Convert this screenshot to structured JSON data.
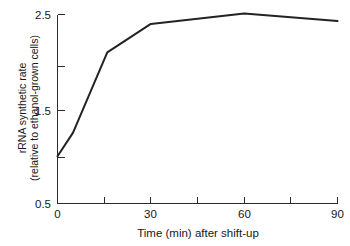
{
  "chart_data": {
    "type": "line",
    "title": "",
    "subtitle": "",
    "xlabel": "Time (min) after shift-up",
    "ylabel": "rRNA synthetic rate (relative to ethanol-grown cells)",
    "ylabel_line1": "rRNA synthetic rate",
    "ylabel_line2": "(relative to ethanol-grown cells)",
    "xlim": [
      0,
      90
    ],
    "ylim": [
      0.5,
      2.5
    ],
    "grid": false,
    "legend": "none",
    "x_major_ticks": [
      0,
      30,
      60,
      90
    ],
    "x_major_tick_labels": [
      "0",
      "30",
      "60",
      "90"
    ],
    "x_minor_ticks": [
      15,
      45,
      75
    ],
    "y_major_ticks": [
      0.5,
      1.5,
      2.5
    ],
    "y_major_tick_labels": [
      "0.5",
      "1.5",
      "2.5"
    ],
    "y_minor_ticks": [
      1.0,
      2.0
    ],
    "series": [
      {
        "name": "rRNA synthetic rate",
        "color": "#232323",
        "x": [
          0,
          5,
          16,
          30,
          60,
          90
        ],
        "y": [
          1.0,
          1.25,
          2.1,
          2.4,
          2.51,
          2.43
        ]
      }
    ]
  },
  "axis": {
    "x_title": "Time (min) after shift-up",
    "y_title_line1": "rRNA synthetic rate",
    "y_title_line2": "(relative to ethanol-grown cells)",
    "x_tick_0": "0",
    "x_tick_1": "30",
    "x_tick_2": "60",
    "x_tick_3": "90",
    "y_tick_0": "0.5",
    "y_tick_1": "1.5",
    "y_tick_2": "2.5"
  },
  "colors": {
    "line": "#232323",
    "axis": "#2b2b2b",
    "text": "#171717",
    "background": "#ffffff"
  }
}
